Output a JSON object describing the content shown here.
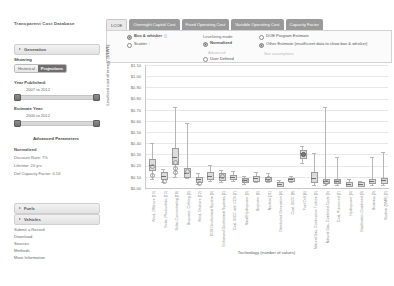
{
  "sidebar": {
    "brand": "Transparent Cost Database",
    "generation_accordion": "Generation",
    "showing_label": "Showing",
    "showing_options": [
      "Historical",
      "Projections"
    ],
    "showing_selected": "Projections",
    "year_published_label": "Year Published:",
    "year_published_value": "2007 to 2012",
    "estimate_year_label": "Estimate Year:",
    "estimate_year_value": "2000 to 2012",
    "advanced_header": "Advanced Parameters",
    "advanced_mode": "Normalized",
    "advanced_lines": [
      "Discount Rate: 7%",
      "Lifetime: 20 yrs",
      "Def Capacity Factor: 0.16"
    ],
    "fuels_accordion": "Fuels",
    "vehicles_accordion": "Vehicles",
    "links": [
      "Submit a Record",
      "Download",
      "Sources",
      "Methods",
      "More Information"
    ]
  },
  "tabs": [
    {
      "label": "LCOE",
      "active": true
    },
    {
      "label": "Overnight Capital Cost",
      "active": false
    },
    {
      "label": "Fixed Operating Cost",
      "active": false
    },
    {
      "label": "Variable Operating Cost",
      "active": false
    },
    {
      "label": "Capacity Factor",
      "active": false
    }
  ],
  "options": {
    "plot_type": {
      "box_whisker": "Box & whisker",
      "scatter": "Scatter",
      "selected": "Box & whisker"
    },
    "levelizing": {
      "header": "Levelizing mode",
      "normalized": "Normalized",
      "normalized_sub": "Advanced",
      "user_defined": "User Defined",
      "selected": "Normalized"
    },
    "legend": {
      "doe": "DOE Program Estimate",
      "other": "Other Estimate (insufficient data to show box & whisker)",
      "assumptions": "See assumptions",
      "selected": "other"
    }
  },
  "chart_data": {
    "type": "boxplot",
    "title": "",
    "xlabel": "Technology (number of values)",
    "ylabel": "Levelized cost of energy ($/kWh)",
    "ylim": [
      0.0,
      1.1
    ],
    "grid": true,
    "legend_position": "top-right",
    "yticks": [
      "$1.10",
      "$1.00",
      "$0.90",
      "$0.80",
      "$0.70",
      "$0.60",
      "$0.50",
      "$0.40",
      "$0.30",
      "$0.20",
      "$0.10",
      "$0.00"
    ],
    "categories": [
      "Wind, Offshore (13)",
      "Solar, Photovoltaic (12)",
      "Solar, Concentrating (18)",
      "Biopower, Cofiring (3)",
      "Wind, Onshore (12)",
      "EGS Geothermal System (9)",
      "Enhanced Geothermal Systems (5)",
      "Coal, IGCC with CCS (7)",
      "Small Hydropower (3)",
      "Biopower (6)",
      "Nuclear (11)",
      "Distributed Generation (4)",
      "Coal, IGCC (8)",
      "Fuel Cell (6)",
      "Natural Gas, Combustion Turbine (5)",
      "Natural Gas, Combined Cycle (9)",
      "Coal, Pulverized (7)",
      "Hydropower (4)",
      "Gasification Combined (3)",
      "Biomass (3)",
      "Nuclear (SMR) (2)"
    ],
    "series": [
      {
        "name": "Wind, Offshore (13)",
        "min": 0.08,
        "q1": 0.17,
        "median": 0.21,
        "q3": 0.26,
        "max": 0.4,
        "points": [
          0.12,
          0.2
        ]
      },
      {
        "name": "Solar, Photovoltaic (12)",
        "min": 0.05,
        "q1": 0.09,
        "median": 0.11,
        "q3": 0.14,
        "max": 0.17,
        "points": [
          0.07
        ]
      },
      {
        "name": "Solar, Concentrating (18)",
        "min": 0.1,
        "q1": 0.22,
        "median": 0.28,
        "q3": 0.36,
        "max": 0.72,
        "points": [
          0.15,
          0.18,
          0.24
        ]
      },
      {
        "name": "Biopower, Cofiring (3)",
        "min": 0.09,
        "q1": 0.11,
        "median": 0.13,
        "q3": 0.18,
        "max": 0.58,
        "points": [
          0.16
        ]
      },
      {
        "name": "Wind, Onshore (12)",
        "min": 0.04,
        "q1": 0.06,
        "median": 0.08,
        "q3": 0.1,
        "max": 0.13,
        "points": [
          0.05
        ]
      },
      {
        "name": "EGS Geothermal System (9)",
        "min": 0.06,
        "q1": 0.09,
        "median": 0.11,
        "q3": 0.14,
        "max": 0.21,
        "points": []
      },
      {
        "name": "Enhanced Geothermal Systems (5)",
        "min": 0.05,
        "q1": 0.08,
        "median": 0.1,
        "q3": 0.13,
        "max": 0.16,
        "points": [
          0.11
        ]
      },
      {
        "name": "Coal, IGCC with CCS (7)",
        "min": 0.06,
        "q1": 0.09,
        "median": 0.1,
        "q3": 0.12,
        "max": 0.15,
        "points": []
      },
      {
        "name": "Small Hydropower (3)",
        "min": 0.04,
        "q1": 0.06,
        "median": 0.07,
        "q3": 0.09,
        "max": 0.11,
        "points": [
          0.08
        ]
      },
      {
        "name": "Biopower (6)",
        "min": 0.05,
        "q1": 0.07,
        "median": 0.09,
        "q3": 0.11,
        "max": 0.14,
        "points": []
      },
      {
        "name": "Nuclear (11)",
        "min": 0.05,
        "q1": 0.07,
        "median": 0.08,
        "q3": 0.1,
        "max": 0.13,
        "points": [
          0.09
        ]
      },
      {
        "name": "Distributed Generation (4)",
        "min": 0.02,
        "q1": 0.03,
        "median": 0.04,
        "q3": 0.05,
        "max": 0.07,
        "points": []
      },
      {
        "name": "Coal, IGCC (8)",
        "min": 0.05,
        "q1": 0.07,
        "median": 0.08,
        "q3": 0.09,
        "max": 0.11,
        "points": []
      },
      {
        "name": "Fuel Cell (6)",
        "min": 0.22,
        "q1": 0.28,
        "median": 0.31,
        "q3": 0.34,
        "max": 0.38,
        "points": [
          0.31
        ]
      },
      {
        "name": "Natural Gas, Combustion Turbine (5)",
        "min": 0.03,
        "q1": 0.06,
        "median": 0.09,
        "q3": 0.14,
        "max": 0.31,
        "points": []
      },
      {
        "name": "Natural Gas, Combined Cycle (9)",
        "min": 0.03,
        "q1": 0.05,
        "median": 0.06,
        "q3": 0.08,
        "max": 0.72,
        "points": [
          0.06
        ]
      },
      {
        "name": "Coal, Pulverized (7)",
        "min": 0.03,
        "q1": 0.05,
        "median": 0.06,
        "q3": 0.08,
        "max": 0.28,
        "points": [
          0.07
        ]
      },
      {
        "name": "Hydropower (4)",
        "min": 0.02,
        "q1": 0.03,
        "median": 0.04,
        "q3": 0.05,
        "max": 0.08,
        "points": []
      },
      {
        "name": "Gasification Combined (3)",
        "min": 0.02,
        "q1": 0.03,
        "median": 0.04,
        "q3": 0.05,
        "max": 0.06,
        "points": []
      },
      {
        "name": "Biomass (3)",
        "min": 0.03,
        "q1": 0.05,
        "median": 0.06,
        "q3": 0.08,
        "max": 0.28,
        "points": []
      },
      {
        "name": "Nuclear (SMR) (2)",
        "min": 0.03,
        "q1": 0.05,
        "median": 0.07,
        "q3": 0.09,
        "max": 0.32,
        "points": []
      }
    ]
  }
}
